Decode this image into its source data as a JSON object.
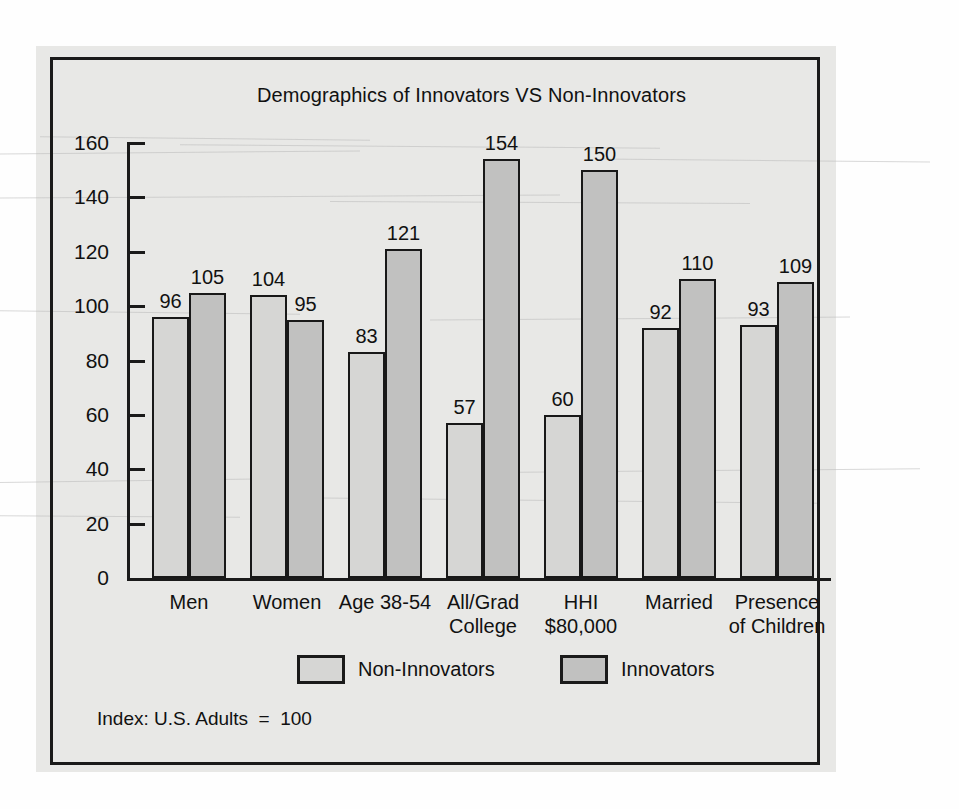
{
  "chart_data": {
    "type": "bar",
    "title": "Demographics of Innovators VS Non-Innovators",
    "xlabel": "",
    "ylabel": "",
    "ylim": [
      0,
      160
    ],
    "ytick_step": 20,
    "yticks": [
      0,
      20,
      40,
      60,
      80,
      100,
      120,
      140,
      160
    ],
    "grid": false,
    "legend_position": "bottom",
    "categories": [
      "Men",
      "Women",
      "Age 38-54",
      "All/Grad College",
      "HHI $80,000",
      "Married",
      "Presence of Children"
    ],
    "category_lines": [
      [
        "Men"
      ],
      [
        "Women"
      ],
      [
        "Age 38-54"
      ],
      [
        "All/Grad",
        "College"
      ],
      [
        "HHI",
        "$80,000"
      ],
      [
        "Married"
      ],
      [
        "Presence",
        "of Children"
      ]
    ],
    "series": [
      {
        "name": "Non-Innovators",
        "color": "#d6d6d4",
        "values": [
          96,
          104,
          83,
          57,
          60,
          92,
          93
        ]
      },
      {
        "name": "Innovators",
        "color": "#c1c1c0",
        "values": [
          105,
          95,
          121,
          154,
          150,
          110,
          109
        ]
      }
    ],
    "annotation": "Index: U.S. Adults  =  100"
  },
  "legend": {
    "items": [
      {
        "label": "Non-Innovators",
        "swatch": "light-gray-swatch"
      },
      {
        "label": "Innovators",
        "swatch": "dark-gray-swatch"
      }
    ]
  },
  "footnote": {
    "text": "Index: U.S. Adults  =  100"
  }
}
